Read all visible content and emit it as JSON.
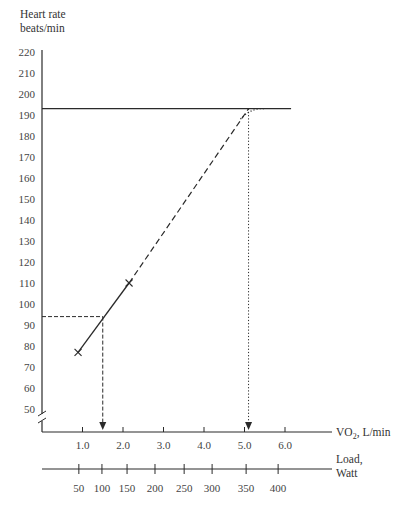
{
  "chart_data": {
    "type": "line",
    "title": "",
    "ylabel": "Heart rate beats/min",
    "ylabel_lines": [
      "Heart rate",
      "beats/min"
    ],
    "xlabel": "VO2, L/min",
    "xlabel_parts": {
      "main": "VO",
      "sub": "2",
      "rest": ", L/min"
    },
    "x2label": "Load, Watt",
    "x2label_lines": [
      "Load,",
      "Watt"
    ],
    "ylim": [
      50,
      220
    ],
    "xlim": [
      0,
      6.5
    ],
    "y_ticks": [
      50,
      60,
      70,
      80,
      90,
      100,
      110,
      120,
      130,
      140,
      150,
      160,
      170,
      180,
      190,
      200,
      210,
      220
    ],
    "x_ticks": [
      1.0,
      2.0,
      3.0,
      4.0,
      5.0,
      6.0
    ],
    "x_tick_labels": [
      "1.0",
      "2.0",
      "3.0",
      "4.0",
      "5.0",
      "6.0"
    ],
    "x2_ticks": [
      50,
      100,
      150,
      200,
      250,
      300,
      350,
      400
    ],
    "x2_tick_labels": [
      "50",
      "100",
      "150",
      "200",
      "250",
      "300",
      "350",
      "400"
    ],
    "x2_tick_positions_vo2": [
      0.91,
      1.48,
      2.1,
      2.79,
      3.51,
      4.2,
      5.04,
      5.83
    ],
    "y_axis_break": true,
    "grid": false,
    "legend": null,
    "series": [
      {
        "name": "Measured (solid)",
        "style": "solid",
        "x": [
          0.89,
          2.15
        ],
        "y": [
          77,
          110
        ]
      },
      {
        "name": "Extrapolation (dashed)",
        "style": "dashed",
        "x": [
          2.15,
          5.1
        ],
        "y": [
          110,
          193
        ]
      },
      {
        "name": "Plateau curve (dotted)",
        "style": "dotted",
        "x": [
          4.9,
          5.1,
          5.3,
          5.5
        ],
        "y": [
          188,
          191,
          193,
          193
        ]
      }
    ],
    "markers": [
      {
        "x": 0.89,
        "y": 77,
        "symbol": "x"
      },
      {
        "x": 2.15,
        "y": 110,
        "symbol": "x"
      }
    ],
    "reference_lines": [
      {
        "type": "horizontal",
        "y": 193,
        "style": "solid",
        "label": "Max heart rate",
        "x_end": 6.15
      },
      {
        "type": "guide",
        "style": "dashed",
        "from": {
          "x": 0,
          "y": 94
        },
        "to": {
          "x": 1.5,
          "y": 94
        }
      },
      {
        "type": "guide-arrow",
        "style": "dashed",
        "from": {
          "x": 1.5,
          "y": 94
        },
        "to_axis": "x",
        "x": 1.5
      },
      {
        "type": "guide-arrow",
        "style": "dotted",
        "from": {
          "x": 5.1,
          "y": 193
        },
        "to_axis": "x",
        "x": 5.1
      }
    ],
    "annotations": [
      {
        "text": "Estimated VO2max ≈ 5.1 L/min",
        "visible": false
      }
    ]
  }
}
